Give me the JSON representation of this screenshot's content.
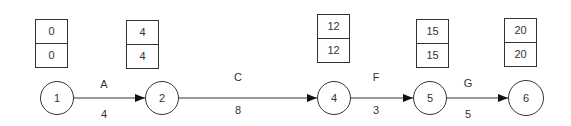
{
  "diagram": {
    "type": "activity-on-arrow network (critical path)",
    "nodes": [
      {
        "id": "1",
        "label": "1",
        "cx": 57,
        "cy": 98,
        "r": 17,
        "early": "0",
        "late": "0",
        "box": {
          "x": 35,
          "y": 19
        }
      },
      {
        "id": "2",
        "label": "2",
        "cx": 162,
        "cy": 98,
        "r": 17,
        "early": "4",
        "late": "4",
        "box": {
          "x": 126,
          "y": 20
        }
      },
      {
        "id": "4",
        "label": "4",
        "cx": 334,
        "cy": 98,
        "r": 17,
        "early": "12",
        "late": "12",
        "box": {
          "x": 317,
          "y": 14
        }
      },
      {
        "id": "5",
        "label": "5",
        "cx": 430,
        "cy": 98,
        "r": 17,
        "early": "15",
        "late": "15",
        "box": {
          "x": 416,
          "y": 19
        }
      },
      {
        "id": "6",
        "label": "6",
        "cx": 526,
        "cy": 98,
        "r": 18,
        "early": "20",
        "late": "20",
        "box": {
          "x": 504,
          "y": 18
        }
      }
    ],
    "edges": [
      {
        "from": "1",
        "to": "2",
        "activity": "A",
        "duration": "4",
        "lx": 104,
        "ly_top": 78,
        "ly_bot": 108
      },
      {
        "from": "2",
        "to": "4",
        "activity": "C",
        "duration": "8",
        "lx": 238,
        "ly_top": 71,
        "ly_bot": 104
      },
      {
        "from": "4",
        "to": "5",
        "activity": "F",
        "duration": "3",
        "lx": 376,
        "ly_top": 71,
        "ly_bot": 104
      },
      {
        "from": "5",
        "to": "6",
        "activity": "G",
        "duration": "5",
        "lx": 468,
        "ly_top": 77,
        "ly_bot": 108
      }
    ]
  }
}
